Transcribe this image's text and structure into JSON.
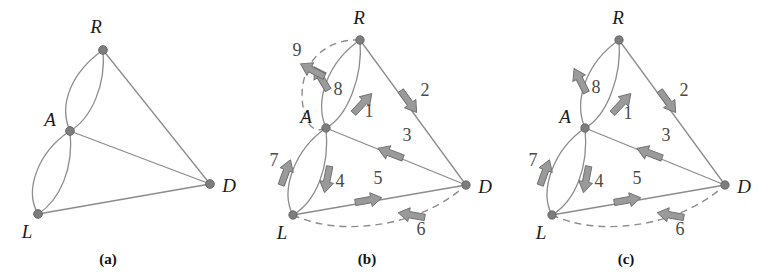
{
  "figure": {
    "type": "graph-diagram",
    "panel_count": 3,
    "colors": {
      "edge": "#8c8c8c",
      "node": "#7d7d7d",
      "arrow_fill": "#9a9a9a",
      "arrow_stroke": "#6e6e6e",
      "label_text": "#1b1b1b",
      "number_text": "#4a4a4a",
      "background": "#ffffff"
    }
  },
  "panels": [
    {
      "id": "a",
      "caption": "(a)",
      "nodes": [
        {
          "id": "R",
          "label": "R",
          "x": 103,
          "y": 50
        },
        {
          "id": "A",
          "label": "A",
          "x": 70,
          "y": 131
        },
        {
          "id": "L",
          "label": "L",
          "x": 38,
          "y": 214
        },
        {
          "id": "D",
          "label": "D",
          "x": 210,
          "y": 184
        }
      ],
      "edges": [
        {
          "from": "R",
          "to": "A",
          "style": "curve-left",
          "dashed": false
        },
        {
          "from": "R",
          "to": "A",
          "style": "curve-right",
          "dashed": false
        },
        {
          "from": "R",
          "to": "D",
          "style": "straight",
          "dashed": false
        },
        {
          "from": "A",
          "to": "D",
          "style": "straight",
          "dashed": false
        },
        {
          "from": "A",
          "to": "L",
          "style": "curve-left",
          "dashed": false
        },
        {
          "from": "A",
          "to": "L",
          "style": "curve-right",
          "dashed": false
        },
        {
          "from": "L",
          "to": "D",
          "style": "straight",
          "dashed": false
        }
      ],
      "arrows": []
    },
    {
      "id": "b",
      "caption": "(b)",
      "nodes": [
        {
          "id": "R",
          "label": "R",
          "x": 101,
          "y": 40
        },
        {
          "id": "A",
          "label": "A",
          "x": 67,
          "y": 128
        },
        {
          "id": "L",
          "label": "L",
          "x": 34,
          "y": 215
        },
        {
          "id": "D",
          "label": "D",
          "x": 207,
          "y": 185
        }
      ],
      "edges": [
        {
          "from": "R",
          "to": "A",
          "style": "curve-outer-left",
          "dashed": true
        },
        {
          "from": "R",
          "to": "A",
          "style": "curve-left",
          "dashed": false
        },
        {
          "from": "R",
          "to": "A",
          "style": "curve-right",
          "dashed": false
        },
        {
          "from": "R",
          "to": "D",
          "style": "straight",
          "dashed": false
        },
        {
          "from": "A",
          "to": "D",
          "style": "straight",
          "dashed": false
        },
        {
          "from": "A",
          "to": "L",
          "style": "curve-left",
          "dashed": false
        },
        {
          "from": "A",
          "to": "L",
          "style": "curve-right",
          "dashed": false
        },
        {
          "from": "L",
          "to": "D",
          "style": "straight",
          "dashed": false
        },
        {
          "from": "L",
          "to": "D",
          "style": "curve-outer-bottom",
          "dashed": true
        }
      ],
      "arrows": [
        {
          "number": "1",
          "from": "A",
          "to": "R",
          "edge": "curve-right",
          "direction": "up-right",
          "label_x": 110,
          "label_y": 110
        },
        {
          "number": "2",
          "from": "R",
          "to": "D",
          "edge": "straight",
          "direction": "down-right",
          "label_x": 163,
          "label_y": 93
        },
        {
          "number": "3",
          "from": "D",
          "to": "A",
          "edge": "straight",
          "direction": "left",
          "label_x": 141,
          "label_y": 143
        },
        {
          "number": "4",
          "from": "A",
          "to": "L",
          "edge": "curve-right",
          "direction": "down",
          "label_x": 80,
          "label_y": 184
        },
        {
          "number": "5",
          "from": "L",
          "to": "D",
          "edge": "straight",
          "direction": "right",
          "label_x": 120,
          "label_y": 184
        },
        {
          "number": "6",
          "from": "D",
          "to": "L",
          "edge": "curve-outer-bottom",
          "direction": "left",
          "label_x": 163,
          "label_y": 230
        },
        {
          "number": "7",
          "from": "L",
          "to": "A",
          "edge": "curve-left",
          "direction": "up",
          "label_x": 17,
          "label_y": 162
        },
        {
          "number": "8",
          "from": "R",
          "to": "A",
          "edge": "curve-left",
          "direction": "down-left",
          "label_x": 79,
          "label_y": 91
        },
        {
          "number": "9",
          "from": "R",
          "to": "A",
          "edge": "curve-outer-left",
          "direction": "down-left",
          "label_x": 39,
          "label_y": 56
        }
      ]
    },
    {
      "id": "c",
      "caption": "(c)",
      "nodes": [
        {
          "id": "R",
          "label": "R",
          "x": 101,
          "y": 40
        },
        {
          "id": "A",
          "label": "A",
          "x": 67,
          "y": 128
        },
        {
          "id": "L",
          "label": "L",
          "x": 34,
          "y": 215
        },
        {
          "id": "D",
          "label": "D",
          "x": 207,
          "y": 185
        }
      ],
      "edges": [
        {
          "from": "R",
          "to": "A",
          "style": "curve-left",
          "dashed": false
        },
        {
          "from": "R",
          "to": "A",
          "style": "curve-right",
          "dashed": false
        },
        {
          "from": "R",
          "to": "D",
          "style": "straight",
          "dashed": false
        },
        {
          "from": "A",
          "to": "D",
          "style": "straight",
          "dashed": false
        },
        {
          "from": "A",
          "to": "L",
          "style": "curve-left",
          "dashed": false
        },
        {
          "from": "A",
          "to": "L",
          "style": "curve-right",
          "dashed": false
        },
        {
          "from": "L",
          "to": "D",
          "style": "straight",
          "dashed": false
        },
        {
          "from": "L",
          "to": "D",
          "style": "curve-outer-bottom",
          "dashed": true
        }
      ],
      "arrows": [
        {
          "number": "1",
          "from": "A",
          "to": "R",
          "edge": "curve-right",
          "direction": "up-right",
          "label_x": 110,
          "label_y": 112
        },
        {
          "number": "2",
          "from": "R",
          "to": "D",
          "edge": "straight",
          "direction": "down-right",
          "label_x": 163,
          "label_y": 93
        },
        {
          "number": "3",
          "from": "D",
          "to": "A",
          "edge": "straight",
          "direction": "left",
          "label_x": 141,
          "label_y": 143
        },
        {
          "number": "4",
          "from": "A",
          "to": "L",
          "edge": "curve-right",
          "direction": "down",
          "label_x": 80,
          "label_y": 184
        },
        {
          "number": "5",
          "from": "L",
          "to": "D",
          "edge": "straight",
          "direction": "right",
          "label_x": 120,
          "label_y": 184
        },
        {
          "number": "6",
          "from": "D",
          "to": "L",
          "edge": "curve-outer-bottom",
          "direction": "left",
          "label_x": 163,
          "label_y": 230
        },
        {
          "number": "7",
          "from": "L",
          "to": "A",
          "edge": "curve-left",
          "direction": "up",
          "label_x": 17,
          "label_y": 162
        },
        {
          "number": "8",
          "from": "R",
          "to": "A",
          "edge": "curve-left",
          "direction": "up",
          "label_x": 79,
          "label_y": 91
        }
      ]
    }
  ]
}
